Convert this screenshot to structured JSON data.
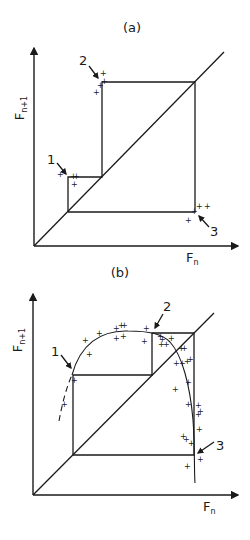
{
  "panels": [
    {
      "id": "a",
      "title": "(a)",
      "ylabel_main": "F",
      "ylabel_sub": "n+1",
      "xlabel_main": "F",
      "xlabel_sub": "n",
      "points": [
        {
          "label": "1"
        },
        {
          "label": "2"
        },
        {
          "label": "3"
        }
      ]
    },
    {
      "id": "b",
      "title": "(b)",
      "ylabel_main": "F",
      "ylabel_sub": "n+1",
      "xlabel_main": "F",
      "xlabel_sub": "n",
      "points": [
        {
          "label": "1"
        },
        {
          "label": "2"
        },
        {
          "label": "3"
        }
      ]
    }
  ],
  "colors": {
    "ink": "#1a1a1a",
    "background": "#ffffff"
  }
}
